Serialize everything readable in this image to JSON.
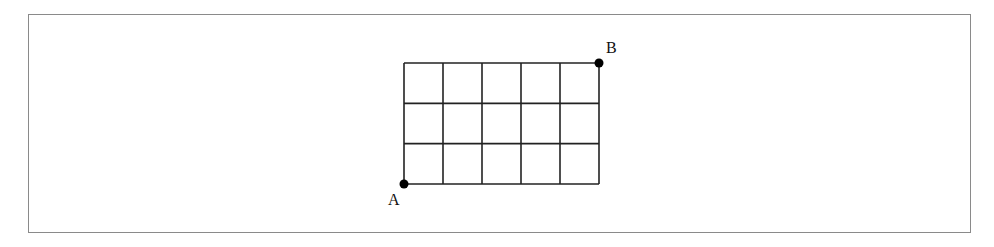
{
  "diagram": {
    "type": "grid-path",
    "columns": 5,
    "rows": 3,
    "grid": {
      "x": 404,
      "y": 63,
      "width": 195,
      "height": 121
    },
    "line_color": "#222222",
    "frame_color": "#8a8a8a",
    "points": [
      {
        "label": "A",
        "position": "bottom-left"
      },
      {
        "label": "B",
        "position": "top-right"
      }
    ]
  }
}
